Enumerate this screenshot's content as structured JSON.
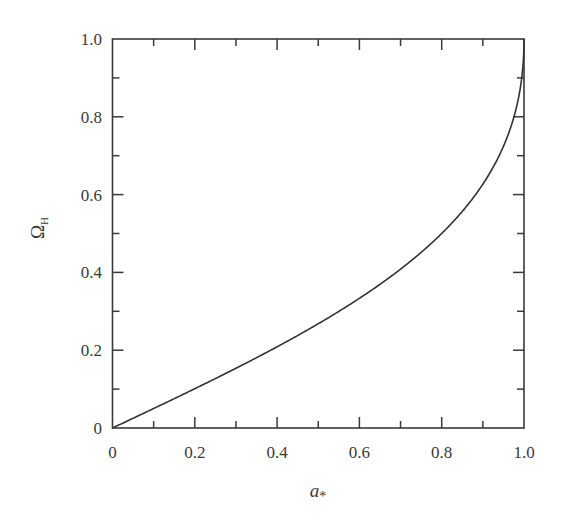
{
  "chart_data": {
    "type": "line",
    "title": "",
    "xlabel": "a*",
    "xlabel_main": "a",
    "xlabel_sub": "*",
    "ylabel": "Ω_H",
    "ylabel_main": "Ω",
    "ylabel_sub": "H",
    "xlim": [
      0,
      1.0
    ],
    "ylim": [
      0,
      1.0
    ],
    "grid": false,
    "legend": null,
    "x_ticks": [
      "0",
      "0.2",
      "0.4",
      "0.6",
      "0.8",
      "1.0"
    ],
    "y_ticks": [
      "0",
      "0.2",
      "0.4",
      "0.6",
      "0.8",
      "1.0"
    ],
    "series": [
      {
        "name": "Ω_H(a*)",
        "color": "#333333",
        "x": [
          0,
          0.1,
          0.2,
          0.3,
          0.4,
          0.5,
          0.6,
          0.7,
          0.8,
          0.9,
          0.95,
          0.99,
          1.0
        ],
        "values": [
          0,
          0.05,
          0.101,
          0.154,
          0.209,
          0.268,
          0.333,
          0.408,
          0.5,
          0.627,
          0.724,
          0.868,
          1.0
        ]
      }
    ]
  }
}
